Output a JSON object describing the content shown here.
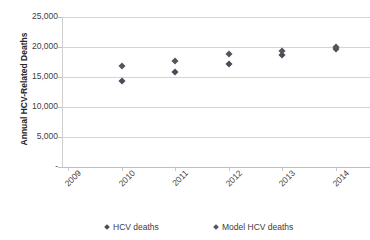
{
  "chart_data": {
    "type": "scatter",
    "title": "",
    "xlabel": "",
    "ylabel": "Annual HCV-Related Deaths",
    "categories": [
      "2009",
      "2010",
      "2011",
      "2012",
      "2013",
      "2014"
    ],
    "x": [
      2009,
      2010,
      2011,
      2012,
      2013,
      2014
    ],
    "ylim": [
      0,
      25000
    ],
    "ytick_values": [
      0,
      5000,
      10000,
      15000,
      20000,
      25000
    ],
    "ytick_labels": [
      "-",
      "5,000",
      "10,000",
      "15,000",
      "20,000",
      "25,000"
    ],
    "grid": true,
    "legend_position": "bottom",
    "series": [
      {
        "name": "HCV deaths",
        "color": "#4a4a58",
        "marker": "diamond",
        "values": [
          null,
          14300,
          15800,
          17200,
          18600,
          19700
        ]
      },
      {
        "name": "Model HCV deaths",
        "color": "#54545f",
        "marker": "diamond",
        "values": [
          null,
          16800,
          17600,
          18800,
          19300,
          20000
        ]
      }
    ]
  },
  "axis": {
    "y_title": "Annual HCV-Related Deaths",
    "y_ticks": [
      {
        "label": "25,000",
        "value": 25000
      },
      {
        "label": "20,000",
        "value": 20000
      },
      {
        "label": "15,000",
        "value": 15000
      },
      {
        "label": "10,000",
        "value": 10000
      },
      {
        "label": "5,000",
        "value": 5000
      },
      {
        "label": "-",
        "value": 0
      }
    ],
    "x_ticks": [
      {
        "label": "2009"
      },
      {
        "label": "2010"
      },
      {
        "label": "2011"
      },
      {
        "label": "2012"
      },
      {
        "label": "2013"
      },
      {
        "label": "2014"
      }
    ]
  },
  "legend": {
    "items": [
      {
        "label": "HCV deaths",
        "color": "#4a4a58"
      },
      {
        "label": "Model HCV deaths",
        "color": "#54545f"
      }
    ]
  },
  "title": ""
}
